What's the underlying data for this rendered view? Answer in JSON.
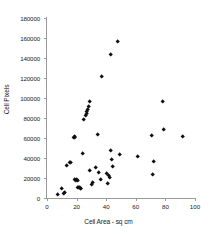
{
  "chart_data": {
    "type": "scatter",
    "title": "",
    "xlabel": "Cell Area - sq cm",
    "ylabel": "Cell Pixels",
    "xlim": [
      0,
      100
    ],
    "ylim": [
      0,
      180000
    ],
    "xticks": [
      0,
      20,
      40,
      60,
      80,
      100
    ],
    "yticks": [
      0,
      20000,
      40000,
      60000,
      80000,
      100000,
      120000,
      140000,
      160000,
      180000
    ],
    "xtick_labels": [
      "0",
      "20",
      "40",
      "60",
      "80",
      "100"
    ],
    "ytick_labels": [
      "0",
      "20000",
      "40000",
      "60000",
      "80000",
      "100000",
      "120000",
      "140000",
      "160000",
      "180000"
    ],
    "grid": false,
    "legend": false,
    "marker": "diamond",
    "marker_color": "#101010",
    "axis_color": "#9a9a9a",
    "series": [
      {
        "name": "Cell Pixels vs Cell Area",
        "points": [
          [
            7,
            3000
          ],
          [
            10,
            9500
          ],
          [
            11,
            4500
          ],
          [
            12,
            5000
          ],
          [
            13,
            32000
          ],
          [
            15,
            35500
          ],
          [
            16,
            35000
          ],
          [
            18,
            60500
          ],
          [
            18.5,
            61000
          ],
          [
            19,
            60000
          ],
          [
            19,
            18500
          ],
          [
            19.5,
            17500
          ],
          [
            20,
            18500
          ],
          [
            20.5,
            17500
          ],
          [
            21,
            10500
          ],
          [
            21.5,
            10000
          ],
          [
            22,
            10000
          ],
          [
            22.5,
            9500
          ],
          [
            23,
            9500
          ],
          [
            24,
            44500
          ],
          [
            25,
            78000
          ],
          [
            26,
            82500
          ],
          [
            26.5,
            84000
          ],
          [
            27,
            86000
          ],
          [
            27.5,
            88000
          ],
          [
            28,
            91000
          ],
          [
            29,
            96000
          ],
          [
            29,
            27500
          ],
          [
            30,
            13500
          ],
          [
            31,
            15500
          ],
          [
            33,
            30000
          ],
          [
            34,
            63500
          ],
          [
            35,
            25500
          ],
          [
            36,
            18500
          ],
          [
            37,
            121000
          ],
          [
            40,
            24500
          ],
          [
            41,
            14000
          ],
          [
            42,
            22000
          ],
          [
            42.5,
            20500
          ],
          [
            43,
            143000
          ],
          [
            43,
            47000
          ],
          [
            44,
            38000
          ],
          [
            44.5,
            31500
          ],
          [
            48,
            156000
          ],
          [
            49,
            43500
          ],
          [
            61,
            41000
          ],
          [
            71,
            62500
          ],
          [
            71.5,
            23500
          ],
          [
            72,
            36000
          ],
          [
            78,
            96000
          ],
          [
            79,
            68000
          ],
          [
            92,
            61000
          ]
        ]
      }
    ]
  }
}
